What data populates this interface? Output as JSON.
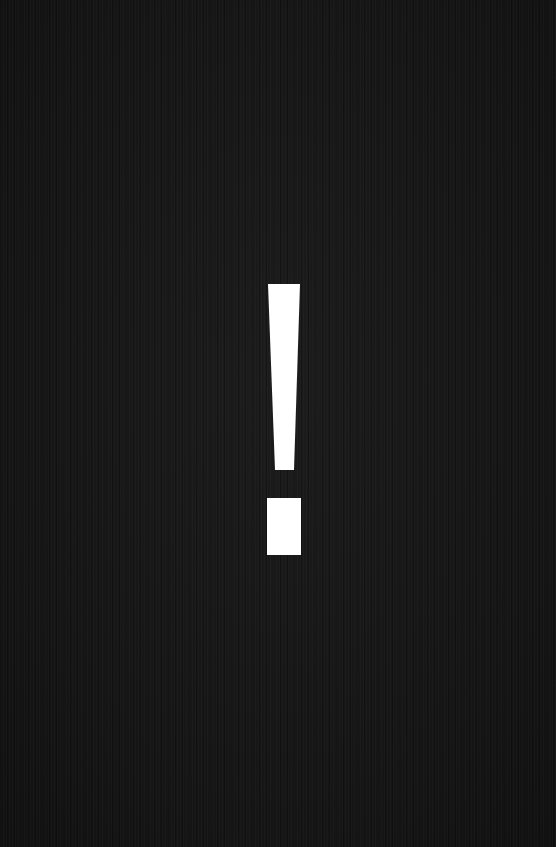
{
  "screen": {
    "background_color": "#161616",
    "glyph": {
      "symbol": "!",
      "icon": "exclamation-mark-icon",
      "color": "#ffffff"
    }
  }
}
